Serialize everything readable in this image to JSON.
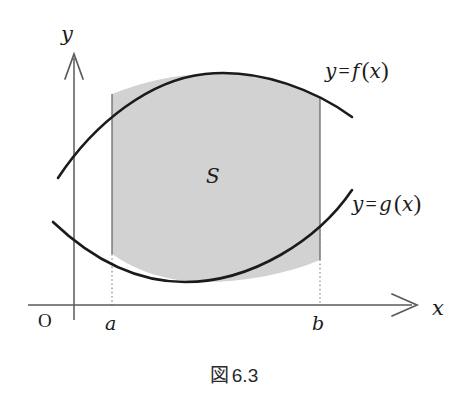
{
  "figure": {
    "caption_symbol": "図",
    "caption_number": "6.3",
    "caption_full": "図 6.3",
    "background_color": "#ffffff",
    "ink_color": "#1b1b1b"
  },
  "axes": {
    "x_axis_label": "x",
    "y_axis_label": "y",
    "origin_label": "O",
    "axis_color": "#5a5a5a",
    "x_axis_y_px": 305,
    "y_axis_x_px": 74,
    "x_axis_start_px": 28,
    "x_axis_end_px": 415,
    "y_axis_top_px": 55,
    "y_axis_bottom_px": 320,
    "arrow_style": "open-v"
  },
  "ticks": [
    {
      "name": "a",
      "label": "a",
      "x_px": 112
    },
    {
      "name": "b",
      "label": "b",
      "x_px": 320
    }
  ],
  "curves": [
    {
      "name": "upper-curve",
      "label": "y = f (x)",
      "label_parts": {
        "var": "y",
        "eq": "=",
        "fn": "f",
        "arg": "x"
      },
      "shape": "concave-down",
      "color": "#1b1b1b",
      "stroke_width": 2.6,
      "path": "M 58,178 C 95,122 150,80 205,74 C 262,68 318,92 352,117"
    },
    {
      "name": "lower-curve",
      "label": "y = g (x)",
      "label_parts": {
        "var": "y",
        "eq": "=",
        "fn": "g",
        "arg": "x"
      },
      "shape": "concave-up",
      "color": "#1b1b1b",
      "stroke_width": 2.6,
      "path": "M 53,222 C 95,262 140,282 185,282 C 252,282 318,240 352,190"
    }
  ],
  "region": {
    "name": "area-between-curves",
    "label": "S",
    "fill_color": "#d2d2d2",
    "fill_opacity": 1,
    "left_bound": "a",
    "right_bound": "b",
    "upper_bound": "y = f (x)",
    "lower_bound": "y = g (x)",
    "path": "M 112,94 C 145,81 175,75 205,74 C 262,68 300,86 320,98 L 320,260 C 285,275 240,282 205,282 C 168,282 136,271 112,254 Z",
    "label_x_px": 212,
    "label_y_px": 176
  },
  "guides": [
    {
      "name": "guide-a",
      "style": "dotted",
      "x_px": 112,
      "y_top_px": 254,
      "y_bottom_px": 305,
      "color": "#8c8c8c"
    },
    {
      "name": "guide-b",
      "style": "dotted",
      "x_px": 320,
      "y_top_px": 230,
      "y_bottom_px": 305,
      "color": "#8c8c8c"
    }
  ],
  "boundary_lines": [
    {
      "name": "left-boundary-a",
      "x_px": 112,
      "y_top_px": 94,
      "y_bottom_px": 254,
      "color": "#6b6b6b"
    },
    {
      "name": "right-boundary-b",
      "x_px": 320,
      "y_top_px": 98,
      "y_bottom_px": 260,
      "color": "#6b6b6b"
    }
  ],
  "label_positions": {
    "f_label_left_px": 325,
    "f_label_top_px": 58,
    "g_label_left_px": 352,
    "g_label_top_px": 191,
    "y_axis_label_left_px": 61,
    "y_axis_label_top_px": 22,
    "x_axis_label_left_px": 432,
    "x_axis_label_top_px": 296,
    "origin_left_px": 38,
    "origin_top_px": 310,
    "a_left_px": 105,
    "a_top_px": 312,
    "b_left_px": 312,
    "b_top_px": 312
  }
}
